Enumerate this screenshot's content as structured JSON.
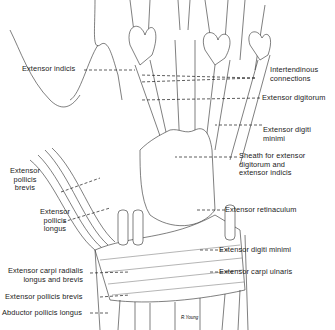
{
  "figure": {
    "signature": "R.Young",
    "labels": [
      {
        "id": "extensor-indicis",
        "text": "Extensor indicis"
      },
      {
        "id": "intertendinous-connections",
        "text": "Intertendinous\nconnections"
      },
      {
        "id": "extensor-digitorum",
        "text": "Extensor digitorum"
      },
      {
        "id": "extensor-digiti-minimi-upper",
        "text": "Extensor digiti\nminimi"
      },
      {
        "id": "sheath-extensor-digitorum-indicis",
        "text": "Sheath for extensor\ndigitorum and\nextensor indicis"
      },
      {
        "id": "extensor-pollicis-brevis-upper",
        "text": "Extensor\npollicis\nbrevis"
      },
      {
        "id": "extensor-pollicis-longus",
        "text": "Extensor\npollicis\nlongus"
      },
      {
        "id": "extensor-retinaculum",
        "text": "Extensor retinaculum"
      },
      {
        "id": "extensor-digiti-minimi-lower",
        "text": "Extensor digiti minimi"
      },
      {
        "id": "extensor-carpi-radialis",
        "text": "Extensor carpi radialis\nlongus and brevis"
      },
      {
        "id": "extensor-carpi-ulnaris",
        "text": "Extensor carpi ulnaris"
      },
      {
        "id": "extensor-pollicis-brevis-lower",
        "text": "Extensor pollicis brevis"
      },
      {
        "id": "abductor-pollicis-longus",
        "text": "Abductor pollicis longus"
      }
    ]
  }
}
